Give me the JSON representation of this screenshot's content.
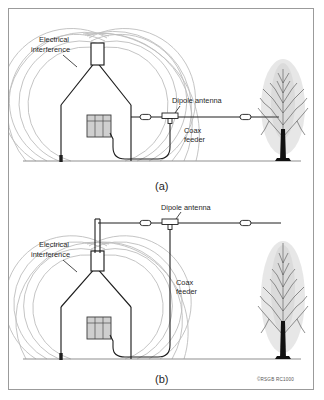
{
  "figure": {
    "credit": "©RSGB RC1000",
    "ink_color": "#1f1f1f",
    "interference_color": "#b9b9b9",
    "ground_color": "#8f8f8f",
    "frame_color": "#9b9b9b",
    "background_color": "#ffffff"
  },
  "panels": [
    {
      "id": "a",
      "caption": "(a)",
      "description": "Dipole antenna strung low from house wall to tree, passing through the electrical interference field",
      "labels": {
        "interference_line1": "Electrical",
        "interference_line2": "interference",
        "dipole": "Dipole antenna",
        "coax_line1": "Coax",
        "coax_line2": "feeder"
      },
      "elements": {
        "house": "house-with-chimney",
        "window": "window",
        "tree": "poplar-tree",
        "ground": "ground-line",
        "earth_rod": "earth-rod",
        "insulators": 2,
        "centre_piece": "dipole-centre-insulator",
        "interference_arcs": 7
      }
    },
    {
      "id": "b",
      "caption": "(b)",
      "description": "Dipole antenna raised on a mast above the chimney and clear of the interference field",
      "labels": {
        "interference_line1": "Electrical",
        "interference_line2": "interference",
        "dipole": "Dipole antenna",
        "coax_line1": "Coax",
        "coax_line2": "feeder"
      },
      "elements": {
        "house": "house-with-chimney",
        "mast": "vertical-mast",
        "window": "window",
        "tree": "poplar-tree",
        "ground": "ground-line",
        "earth_rod": "earth-rod",
        "insulators": 2,
        "centre_piece": "dipole-centre-insulator",
        "interference_arcs": 7
      }
    }
  ]
}
